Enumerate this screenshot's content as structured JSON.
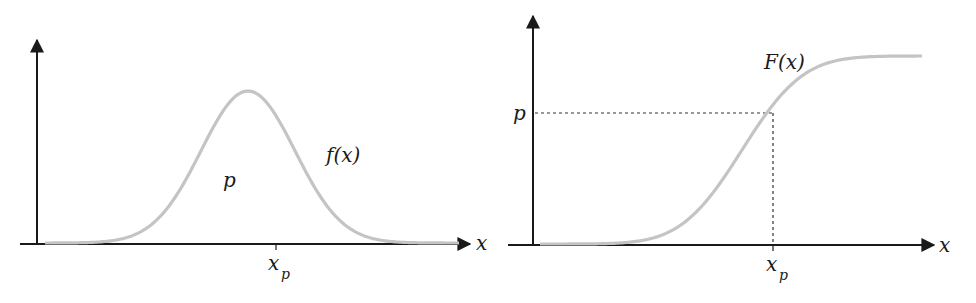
{
  "colors": {
    "axis": "#1a1a1a",
    "curve": "#c4c4c4",
    "guide": "#333333",
    "background": "#ffffff"
  },
  "left_panel": {
    "name": "pdf",
    "curve_label": "f(x)",
    "area_label": "p",
    "x_axis_label": "x",
    "tick_label_main": "x",
    "tick_label_sub": "p"
  },
  "right_panel": {
    "name": "cdf",
    "curve_label": "F(x)",
    "y_tick_label": "p",
    "x_axis_label": "x",
    "tick_label_main": "x",
    "tick_label_sub": "p"
  },
  "chart_data": [
    {
      "type": "line",
      "title": "",
      "description": "Probability density function f(x), bell-shaped curve; area p to the left of x_p",
      "xlabel": "x",
      "ylabel": "",
      "series": [
        {
          "name": "f(x)",
          "shape": "normal density"
        }
      ],
      "annotations": [
        "f(x)",
        "p",
        "x_p"
      ],
      "x_ticks": [
        "x_p"
      ],
      "grid": false
    },
    {
      "type": "line",
      "title": "",
      "description": "Cumulative distribution function F(x), S-shaped curve; F(x_p) = p shown with dashed guide lines",
      "xlabel": "x",
      "ylabel": "",
      "series": [
        {
          "name": "F(x)",
          "shape": "normal CDF (sigmoid)"
        }
      ],
      "annotations": [
        "F(x)"
      ],
      "x_ticks": [
        "x_p"
      ],
      "y_ticks": [
        "p"
      ],
      "grid": false
    }
  ]
}
